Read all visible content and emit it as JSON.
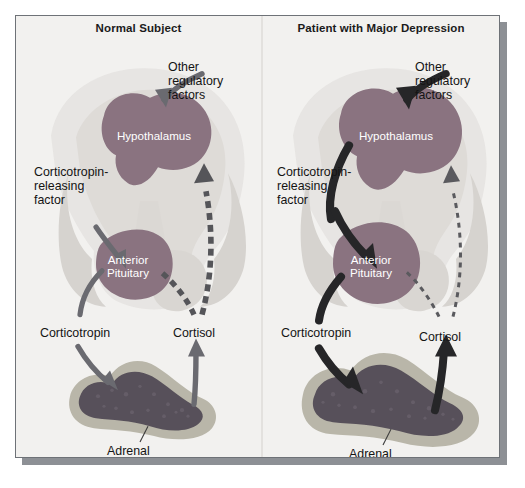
{
  "figure": {
    "type": "medical-diagram",
    "background_color": "#f2f1ef",
    "frame_border_color": "#6e7277",
    "shadow_color": "#8d9095"
  },
  "panels": [
    {
      "id": "normal",
      "title": "Normal Subject",
      "labels": {
        "other_regulatory_factors": "Other\nregulatory\nfactors",
        "hypothalamus": "Hypothalamus",
        "crf": "Corticotropin-\nreleasing\nfactor",
        "anterior_pituitary": "Anterior\nPituitary",
        "corticotropin": "Corticotropin",
        "cortisol": "Cortisol",
        "adrenal_cortex": "Adrenal\ncortex"
      },
      "arrow_weights": {
        "other_regulatory_factors": "medium",
        "crf": "medium",
        "corticotropin": "medium",
        "cortisol": "medium",
        "feedback_to_hypothalamus": "thick-dashed",
        "feedback_to_pituitary": "thick-dashed"
      },
      "organ_sizes": {
        "hypothalamus": "normal",
        "anterior_pituitary": "normal",
        "adrenal_cortex": "normal"
      }
    },
    {
      "id": "depression",
      "title": "Patient with Major Depression",
      "labels": {
        "other_regulatory_factors": "Other\nregulatory\nfactors",
        "hypothalamus": "Hypothalamus",
        "crf": "Corticotropin-\nreleasing\nfactor",
        "anterior_pituitary": "Anterior\nPituitary",
        "corticotropin": "Corticotropin",
        "cortisol": "Cortisol",
        "adrenal_cortex": "Adrenal\ncortex"
      },
      "arrow_weights": {
        "other_regulatory_factors": "thick",
        "crf": "thick",
        "corticotropin": "thick",
        "cortisol": "thick",
        "feedback_to_hypothalamus": "thin-dashed",
        "feedback_to_pituitary": "thin-dashed"
      },
      "organ_sizes": {
        "hypothalamus": "enlarged",
        "anterior_pituitary": "enlarged",
        "adrenal_cortex": "enlarged"
      }
    }
  ],
  "colors": {
    "hypothalamus_fill": "#8a7380",
    "pituitary_fill": "#8a7380",
    "brain_light": "#e2e0dd",
    "brain_mid": "#d2cfcb",
    "adrenal_cortex_rim": "#b9b6a9",
    "adrenal_medulla": "#5b5358",
    "arrow_normal": "#6a6a70",
    "arrow_bold": "#2b2b2d",
    "label_text": "#141414",
    "organ_text": "#ffffff"
  }
}
